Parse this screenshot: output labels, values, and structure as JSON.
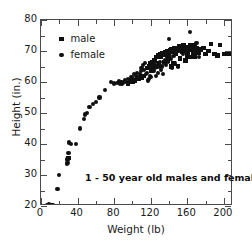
{
  "chart_data": {
    "type": "scatter",
    "title": "",
    "xlabel": "Weight (lb)",
    "ylabel": "Height (in.)",
    "xlim": [
      0,
      210
    ],
    "ylim": [
      20,
      80
    ],
    "xticks": [
      0,
      40,
      80,
      120,
      160,
      200
    ],
    "yticks": [
      20,
      30,
      40,
      50,
      60,
      70,
      80
    ],
    "xminor_step": 20,
    "yminor_step": 5,
    "grid": false,
    "legend_position": "upper-left-inside",
    "annotation": "1 - 50 year old males and females",
    "marker_color": "#101010",
    "frame_color": "#4a4a4a",
    "background": "#ffffff",
    "series": [
      {
        "name": "male",
        "marker": "square",
        "points": [
          [
            95,
            59.5
          ],
          [
            98,
            60.0
          ],
          [
            100,
            60.2
          ],
          [
            103,
            60.5
          ],
          [
            105,
            61.0
          ],
          [
            107,
            61.2
          ],
          [
            110,
            61.5
          ],
          [
            112,
            62.0
          ],
          [
            116,
            64.5
          ],
          [
            118,
            65.0
          ],
          [
            120,
            66.0
          ],
          [
            122,
            66.5
          ],
          [
            124,
            67.0
          ],
          [
            126,
            68.0
          ],
          [
            128,
            68.5
          ],
          [
            130,
            69.0
          ],
          [
            131,
            68.0
          ],
          [
            133,
            69.3
          ],
          [
            135,
            68.8
          ],
          [
            136,
            69.5
          ],
          [
            138,
            70.0
          ],
          [
            140,
            69.0
          ],
          [
            141,
            70.2
          ],
          [
            143,
            70.5
          ],
          [
            145,
            69.8
          ],
          [
            146,
            71.0
          ],
          [
            148,
            70.0
          ],
          [
            150,
            70.5
          ],
          [
            151,
            71.5
          ],
          [
            153,
            70.8
          ],
          [
            155,
            71.0
          ],
          [
            156,
            72.0
          ],
          [
            158,
            70.2
          ],
          [
            160,
            71.2
          ],
          [
            161,
            70.0
          ],
          [
            163,
            71.8
          ],
          [
            165,
            71.0
          ],
          [
            166,
            70.5
          ],
          [
            168,
            72.0
          ],
          [
            170,
            71.0
          ],
          [
            171,
            70.0
          ],
          [
            143,
            65.0
          ],
          [
            150,
            65.2
          ],
          [
            158,
            67.0
          ],
          [
            163,
            68.0
          ],
          [
            167,
            69.0
          ],
          [
            172,
            69.5
          ],
          [
            175,
            70.5
          ],
          [
            178,
            71.0
          ],
          [
            180,
            69.0
          ],
          [
            183,
            70.0
          ],
          [
            186,
            72.2
          ],
          [
            190,
            69.0
          ],
          [
            193,
            68.5
          ],
          [
            196,
            72.0
          ],
          [
            200,
            69.0
          ],
          [
            205,
            69.0
          ],
          [
            140,
            68.0
          ],
          [
            147,
            69.2
          ],
          [
            154,
            69.8
          ],
          [
            30,
            35.5
          ],
          [
            145,
            66.0
          ],
          [
            152,
            67.5
          ],
          [
            160,
            68.5
          ],
          [
            168,
            68.0
          ],
          [
            135,
            66.5
          ],
          [
            139,
            67.0
          ],
          [
            129,
            66.0
          ],
          [
            125,
            65.0
          ],
          [
            121,
            63.5
          ]
        ]
      },
      {
        "name": "female",
        "marker": "circle",
        "points": [
          [
            7,
            20.2
          ],
          [
            8,
            20.0
          ],
          [
            9,
            20.3
          ],
          [
            10,
            20.1
          ],
          [
            11,
            20.4
          ],
          [
            12,
            20.2
          ],
          [
            10,
            20.0
          ],
          [
            9,
            20.5
          ],
          [
            13,
            20.3
          ],
          [
            18,
            25.5
          ],
          [
            20,
            30.0
          ],
          [
            28,
            33.5
          ],
          [
            29,
            34.0
          ],
          [
            29,
            35.0
          ],
          [
            30,
            37.0
          ],
          [
            31,
            40.5
          ],
          [
            33,
            40.0
          ],
          [
            38,
            40.0
          ],
          [
            43,
            45.0
          ],
          [
            47,
            48.0
          ],
          [
            48,
            49.5
          ],
          [
            50,
            50.0
          ],
          [
            53,
            52.0
          ],
          [
            57,
            53.0
          ],
          [
            60,
            53.5
          ],
          [
            64,
            55.0
          ],
          [
            70,
            57.5
          ],
          [
            77,
            60.0
          ],
          [
            80,
            59.5
          ],
          [
            83,
            59.8
          ],
          [
            86,
            59.5
          ],
          [
            88,
            60.0
          ],
          [
            90,
            59.8
          ],
          [
            92,
            60.5
          ],
          [
            95,
            61.0
          ],
          [
            97,
            60.5
          ],
          [
            99,
            61.5
          ],
          [
            101,
            61.0
          ],
          [
            104,
            62.0
          ],
          [
            106,
            61.5
          ],
          [
            108,
            62.5
          ],
          [
            110,
            64.5
          ],
          [
            112,
            65.5
          ],
          [
            113,
            64.0
          ],
          [
            115,
            62.5
          ],
          [
            116,
            63.0
          ],
          [
            117,
            60.5
          ],
          [
            118,
            61.0
          ],
          [
            119,
            62.0
          ],
          [
            120,
            61.5
          ],
          [
            121,
            64.0
          ],
          [
            122,
            65.0
          ],
          [
            123,
            63.5
          ],
          [
            124,
            66.0
          ],
          [
            125,
            64.5
          ],
          [
            126,
            62.0
          ],
          [
            127,
            65.5
          ],
          [
            128,
            63.0
          ],
          [
            129,
            64.8
          ],
          [
            130,
            66.5
          ],
          [
            131,
            64.0
          ],
          [
            132,
            65.0
          ],
          [
            133,
            62.5
          ],
          [
            135,
            66.0
          ],
          [
            136,
            67.0
          ],
          [
            137,
            65.5
          ],
          [
            138,
            68.0
          ],
          [
            139,
            66.5
          ],
          [
            140,
            74.0
          ],
          [
            142,
            67.5
          ],
          [
            143,
            64.5
          ],
          [
            145,
            68.5
          ],
          [
            146,
            66.0
          ],
          [
            148,
            69.5
          ],
          [
            150,
            65.0
          ],
          [
            152,
            70.0
          ],
          [
            155,
            69.0
          ],
          [
            157,
            71.0
          ],
          [
            160,
            70.5
          ],
          [
            163,
            76.0
          ],
          [
            165,
            72.0
          ],
          [
            166,
            70.0
          ],
          [
            168,
            71.5
          ],
          [
            170,
            72.5
          ],
          [
            172,
            70.0
          ],
          [
            173,
            68.0
          ],
          [
            114,
            66.0
          ],
          [
            109,
            63.5
          ],
          [
            111,
            62.0
          ],
          [
            105,
            63.0
          ],
          [
            102,
            62.5
          ],
          [
            93,
            60.0
          ],
          [
            89,
            59.5
          ],
          [
            85,
            60.2
          ]
        ]
      }
    ]
  },
  "legend": {
    "items": [
      {
        "label": "male",
        "marker": "square"
      },
      {
        "label": "female",
        "marker": "circle"
      }
    ]
  },
  "axes": {
    "x_title": "Weight (lb)",
    "y_title": "Height (in.)",
    "x_tick_labels": [
      "0",
      "40",
      "80",
      "120",
      "160",
      "200"
    ],
    "y_tick_labels": [
      "20",
      "30",
      "40",
      "50",
      "60",
      "70",
      "80"
    ]
  },
  "annotation": {
    "text": "1 - 50 year old males and females"
  }
}
